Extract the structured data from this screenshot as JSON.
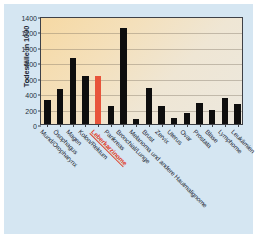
{
  "figure": {
    "background_color": "#d5e6f2",
    "plot_background": "#f4dfb4",
    "axis_color": "#3e4147"
  },
  "chart_data": {
    "type": "bar",
    "title": "",
    "xlabel": "",
    "ylabel": "Todesfälle in 1000",
    "ylim": [
      0,
      1400
    ],
    "yticks": [
      0,
      200,
      400,
      600,
      800,
      1000,
      1200,
      1400
    ],
    "grid": true,
    "legend": "none",
    "bar_color": "#0e0e0e",
    "highlight_color": "#e8543a",
    "highlight_category": "Leberkarzinome",
    "categories": [
      "Mund/Oropharynx",
      "Ösophagus",
      "Magen",
      "Kolon/Rektum",
      "Leberkarzinome",
      "Pankreas",
      "Bronchial/Lunge",
      "Melanoma und andere Hautmalignome",
      "Brust",
      "Zervix",
      "Uterus",
      "Ovar",
      "Prostata",
      "Blase",
      "Lymphome",
      "Leukämien"
    ],
    "values": [
      310,
      455,
      850,
      620,
      620,
      235,
      1245,
      65,
      470,
      240,
      75,
      140,
      270,
      180,
      335,
      265
    ]
  }
}
